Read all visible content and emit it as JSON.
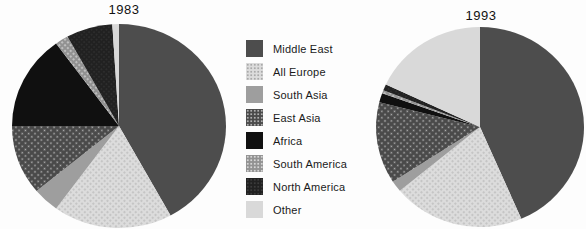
{
  "figure": {
    "left_title": "1983",
    "right_title": "1993"
  },
  "legend": {
    "items": [
      {
        "key": "middle_east",
        "label": "Middle East"
      },
      {
        "key": "all_europe",
        "label": "All Europe"
      },
      {
        "key": "south_asia",
        "label": "South Asia"
      },
      {
        "key": "east_asia",
        "label": "East Asia"
      },
      {
        "key": "africa",
        "label": "Africa"
      },
      {
        "key": "south_america",
        "label": "South America"
      },
      {
        "key": "north_america",
        "label": "North America"
      },
      {
        "key": "other",
        "label": "Other"
      }
    ]
  },
  "palette": {
    "middle_east": {
      "fill": "#4d4d4d",
      "dot": null,
      "spacing": 0,
      "dot_r": 0
    },
    "all_europe": {
      "fill": "#dcdcdc",
      "dot": "#a9a9a9",
      "spacing": 4,
      "dot_r": 0.8
    },
    "south_asia": {
      "fill": "#9e9e9e",
      "dot": null,
      "spacing": 0,
      "dot_r": 0
    },
    "east_asia": {
      "fill": "#4a4a4a",
      "dot": "#b0b0b0",
      "spacing": 4.5,
      "dot_r": 0.9
    },
    "africa": {
      "fill": "#101010",
      "dot": null,
      "spacing": 0,
      "dot_r": 0
    },
    "south_america": {
      "fill": "#929292",
      "dot": "#d6d6d6",
      "spacing": 4,
      "dot_r": 0.9
    },
    "north_america": {
      "fill": "#212121",
      "dot": "#3c3c3c",
      "spacing": 3.5,
      "dot_r": 0.7
    },
    "other": {
      "fill": "#d9d9d9",
      "dot": null,
      "spacing": 0,
      "dot_r": 0
    }
  },
  "chart_data": [
    {
      "type": "pie",
      "title": "1983",
      "categories": [
        "Middle East",
        "All Europe",
        "South Asia",
        "East Asia",
        "Africa",
        "South America",
        "North America",
        "Other"
      ],
      "values": [
        42,
        18,
        4,
        11,
        15,
        2,
        7,
        1
      ],
      "unit": "percent",
      "start_angle_deg": 0,
      "direction": "clockwise",
      "legend_position": "center-between-pies"
    },
    {
      "type": "pie",
      "title": "1993",
      "categories": [
        "Middle East",
        "All Europe",
        "South Asia",
        "East Asia",
        "Africa",
        "South America",
        "North America",
        "Other"
      ],
      "values": [
        43.5,
        20.5,
        1.8,
        13.2,
        1.5,
        0.5,
        1.0,
        18.0
      ],
      "unit": "percent",
      "start_angle_deg": 0,
      "direction": "clockwise",
      "legend_position": "center-between-pies"
    }
  ]
}
